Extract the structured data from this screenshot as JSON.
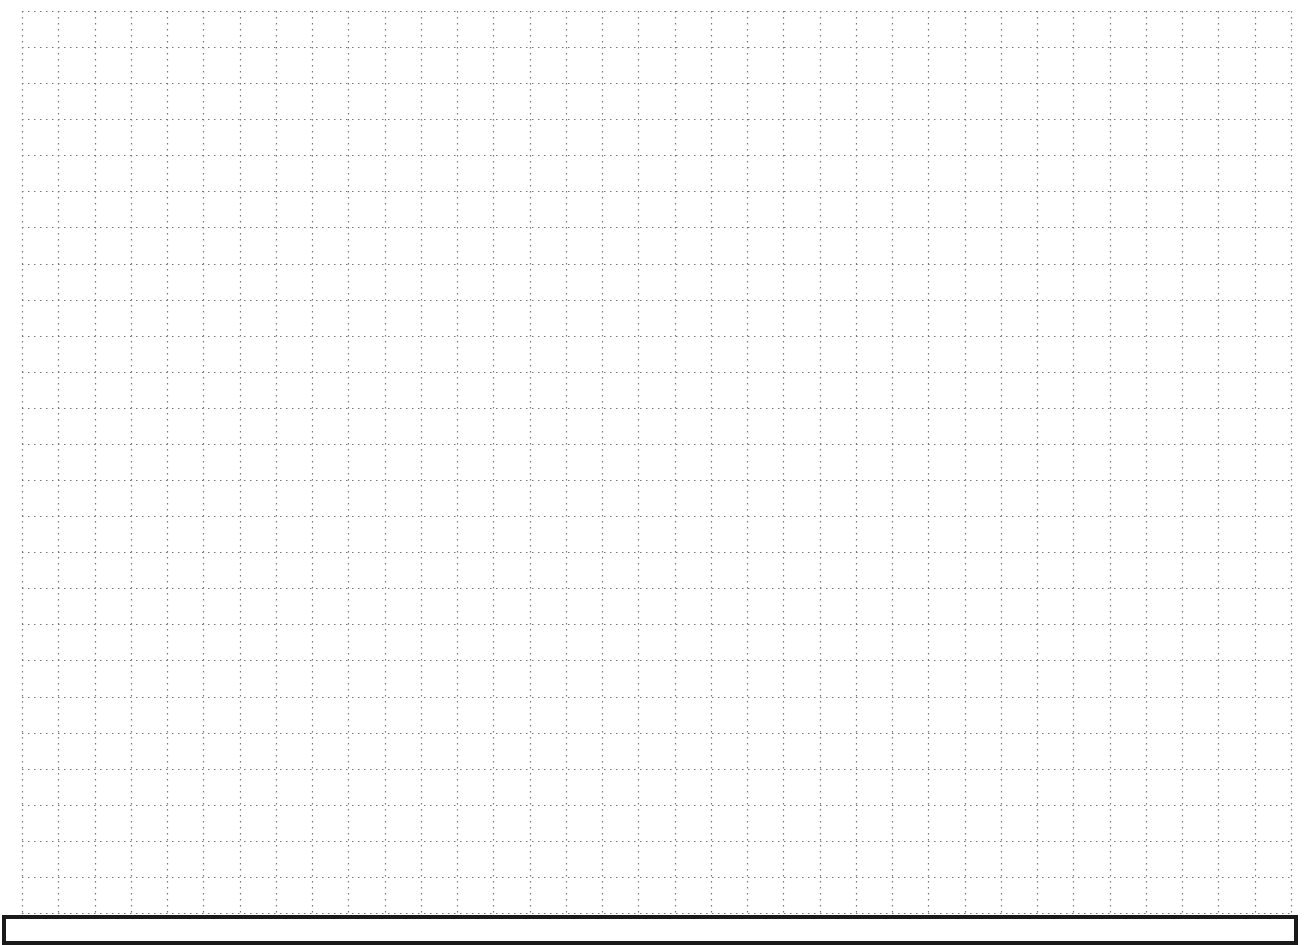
{
  "grid": {
    "x0": 22,
    "y0": 11,
    "x1": 1291,
    "y1": 913,
    "cols": 35,
    "rows": 25,
    "line_color": "#777777",
    "dash": "1.5 4.5"
  },
  "answer_box": {
    "text": "",
    "border_color": "#1a1a1a"
  }
}
